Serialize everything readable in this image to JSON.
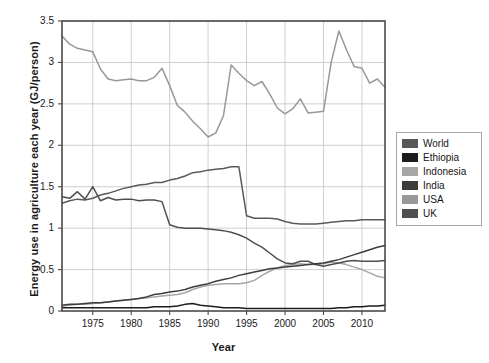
{
  "chart_data": {
    "type": "line",
    "title": "",
    "xlabel": "Year",
    "ylabel": "Energy use in agriculture each year (GJ/person)",
    "xlim": [
      1971,
      2013
    ],
    "ylim": [
      0,
      3.5
    ],
    "xticks": [
      1975,
      1980,
      1985,
      1990,
      1995,
      2000,
      2005,
      2010
    ],
    "yticks": [
      0,
      0.5,
      1,
      1.5,
      2,
      2.5,
      3,
      3.5
    ],
    "ytick_labels": [
      "0",
      "0.5",
      "1",
      "1.5",
      "2",
      "2.5",
      "3",
      "3.5"
    ],
    "xtick_labels": [
      "1975",
      "1980",
      "1985",
      "1990",
      "1995",
      "2000",
      "2005",
      "2010"
    ],
    "grid": true,
    "legend_position": "right-outside",
    "x": [
      1971,
      1972,
      1973,
      1974,
      1975,
      1976,
      1977,
      1978,
      1979,
      1980,
      1981,
      1982,
      1983,
      1984,
      1985,
      1986,
      1987,
      1988,
      1989,
      1990,
      1991,
      1992,
      1993,
      1994,
      1995,
      1996,
      1997,
      1998,
      1999,
      2000,
      2001,
      2002,
      2003,
      2004,
      2005,
      2006,
      2007,
      2008,
      2009,
      2010,
      2011,
      2012,
      2013
    ],
    "series": [
      {
        "name": "World",
        "color": "#595959",
        "values": [
          1.3,
          1.33,
          1.35,
          1.34,
          1.36,
          1.4,
          1.42,
          1.45,
          1.48,
          1.5,
          1.52,
          1.53,
          1.55,
          1.55,
          1.58,
          1.6,
          1.63,
          1.67,
          1.68,
          1.7,
          1.71,
          1.72,
          1.74,
          1.74,
          1.15,
          1.12,
          1.12,
          1.12,
          1.11,
          1.08,
          1.06,
          1.05,
          1.05,
          1.05,
          1.06,
          1.07,
          1.08,
          1.09,
          1.09,
          1.1,
          1.1,
          1.1,
          1.1
        ]
      },
      {
        "name": "Ethiopia",
        "color": "#1c1c1c",
        "values": [
          0.04,
          0.04,
          0.04,
          0.04,
          0.04,
          0.04,
          0.04,
          0.04,
          0.04,
          0.04,
          0.04,
          0.04,
          0.05,
          0.05,
          0.05,
          0.06,
          0.08,
          0.09,
          0.07,
          0.06,
          0.05,
          0.04,
          0.04,
          0.04,
          0.03,
          0.03,
          0.03,
          0.03,
          0.03,
          0.03,
          0.03,
          0.03,
          0.03,
          0.03,
          0.03,
          0.03,
          0.04,
          0.04,
          0.05,
          0.05,
          0.06,
          0.06,
          0.07
        ]
      },
      {
        "name": "Indonesia",
        "color": "#a6a6a6",
        "values": [
          0.06,
          0.07,
          0.08,
          0.08,
          0.09,
          0.1,
          0.11,
          0.12,
          0.13,
          0.14,
          0.15,
          0.16,
          0.17,
          0.18,
          0.19,
          0.2,
          0.22,
          0.26,
          0.29,
          0.31,
          0.32,
          0.33,
          0.33,
          0.33,
          0.34,
          0.37,
          0.43,
          0.48,
          0.52,
          0.55,
          0.56,
          0.57,
          0.56,
          0.56,
          0.57,
          0.59,
          0.58,
          0.56,
          0.53,
          0.5,
          0.46,
          0.42,
          0.4
        ]
      },
      {
        "name": "India",
        "color": "#3d3d3d",
        "values": [
          0.07,
          0.08,
          0.08,
          0.09,
          0.1,
          0.1,
          0.11,
          0.12,
          0.13,
          0.14,
          0.15,
          0.17,
          0.2,
          0.21,
          0.23,
          0.24,
          0.26,
          0.29,
          0.31,
          0.33,
          0.36,
          0.38,
          0.4,
          0.43,
          0.45,
          0.47,
          0.49,
          0.51,
          0.52,
          0.53,
          0.54,
          0.55,
          0.56,
          0.57,
          0.58,
          0.6,
          0.62,
          0.65,
          0.68,
          0.71,
          0.74,
          0.77,
          0.79
        ]
      },
      {
        "name": "USA",
        "color": "#989898",
        "values": [
          3.32,
          3.22,
          3.17,
          3.15,
          3.13,
          2.92,
          2.8,
          2.78,
          2.79,
          2.8,
          2.78,
          2.78,
          2.82,
          2.93,
          2.72,
          2.48,
          2.4,
          2.29,
          2.2,
          2.1,
          2.15,
          2.36,
          2.97,
          2.87,
          2.78,
          2.72,
          2.77,
          2.62,
          2.45,
          2.38,
          2.44,
          2.56,
          2.39,
          2.4,
          2.41,
          3.0,
          3.38,
          3.15,
          2.95,
          2.93,
          2.75,
          2.8,
          2.7
        ]
      },
      {
        "name": "UK",
        "color": "#4f4f4f",
        "values": [
          1.38,
          1.36,
          1.44,
          1.35,
          1.5,
          1.33,
          1.37,
          1.34,
          1.35,
          1.35,
          1.33,
          1.34,
          1.34,
          1.32,
          1.04,
          1.01,
          1.0,
          1.0,
          1.0,
          0.99,
          0.98,
          0.97,
          0.95,
          0.92,
          0.88,
          0.82,
          0.77,
          0.7,
          0.63,
          0.58,
          0.57,
          0.6,
          0.6,
          0.56,
          0.54,
          0.56,
          0.58,
          0.6,
          0.61,
          0.6,
          0.6,
          0.6,
          0.61
        ]
      }
    ]
  },
  "legend": {
    "items": [
      {
        "label": "World",
        "color": "#595959"
      },
      {
        "label": "Ethiopia",
        "color": "#1c1c1c"
      },
      {
        "label": "Indonesia",
        "color": "#a6a6a6"
      },
      {
        "label": "India",
        "color": "#3d3d3d"
      },
      {
        "label": "USA",
        "color": "#989898"
      },
      {
        "label": "UK",
        "color": "#4f4f4f"
      }
    ]
  },
  "style": {
    "axis_color": "#4a4a4a",
    "grid_color": "#c9c9c9",
    "text_color": "#1a1a1a",
    "background": "#ffffff"
  }
}
